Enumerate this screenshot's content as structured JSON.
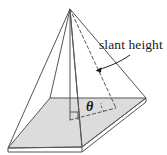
{
  "figure": {
    "type": "geometry-diagram",
    "background_color": "#ffffff",
    "stroke_color": "#555555",
    "base_fill_color": "#dcdcdc",
    "text_color": "#1a1a1a"
  },
  "labels": {
    "slant_height": "slant height",
    "theta": "θ"
  },
  "geometry": {
    "apex": [
      70,
      9
    ],
    "base_vertices": {
      "left": [
        8,
        148
      ],
      "back_left": [
        50,
        98
      ],
      "right": [
        146,
        98
      ],
      "front": [
        82,
        147
      ]
    },
    "altitude_foot": [
      70,
      120
    ],
    "slant_foot": [
      116,
      108
    ],
    "right_angle_marker": [
      70,
      120
    ],
    "leader_arrow_tip": [
      96,
      71
    ]
  }
}
